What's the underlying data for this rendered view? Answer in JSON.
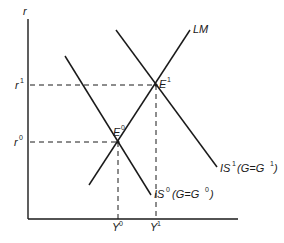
{
  "diagram": {
    "type": "IS-LM diagram",
    "axes": {
      "y_label": "r",
      "x_label": ""
    },
    "curves": {
      "lm": {
        "label": "LM"
      },
      "is0": {
        "label": "IS",
        "sup": "0",
        "condition": "(G=G",
        "condition_sup": "0",
        "condition_close": ")"
      },
      "is1": {
        "label": "IS",
        "sup": "1",
        "condition": "(G=G",
        "condition_sup": "1",
        "condition_close": ")"
      }
    },
    "points": {
      "e0": {
        "label": "E",
        "sup": "0"
      },
      "e1": {
        "label": "E",
        "sup": "1"
      }
    },
    "ticks": {
      "r0": {
        "label": "r",
        "sup": "0"
      },
      "r1": {
        "label": "r",
        "sup": "1"
      },
      "y0": {
        "label": "Y",
        "sup": "0"
      },
      "y1": {
        "label": "Y",
        "sup": "1"
      }
    },
    "colors": {
      "line": "#1a1a1a",
      "background": "#ffffff"
    }
  }
}
